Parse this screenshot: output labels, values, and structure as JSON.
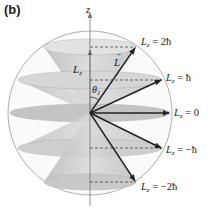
{
  "panel_label": "(b)",
  "axis_label": "z",
  "vector_label": "L",
  "component_label": "L",
  "component_sub": "z",
  "angle_label": "θ",
  "angle_sub": "1",
  "levels": [
    {
      "name": "Lz=2hbar",
      "text": "= 2ħ",
      "sub": "z"
    },
    {
      "name": "Lz=hbar",
      "text": "= ħ",
      "sub": "z"
    },
    {
      "name": "Lz=0",
      "text": "= 0",
      "sub": "z"
    },
    {
      "name": "Lz=-hbar",
      "text": "= −ħ",
      "sub": "z"
    },
    {
      "name": "Lz=-2hbar",
      "text": "= −2ħ",
      "sub": "z"
    }
  ],
  "colors": {
    "cone_fill": "#c8c8c8",
    "cone_dark": "#a9a9a9",
    "sphere": "#9a9a9a",
    "arrow": "#222222"
  }
}
